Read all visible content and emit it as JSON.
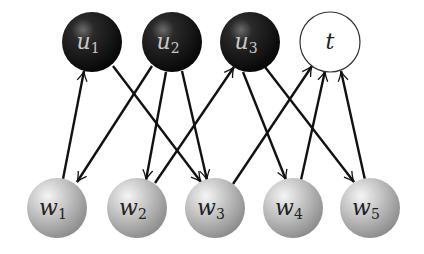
{
  "diagram": {
    "type": "bipartite-directed-graph",
    "top_nodes": [
      {
        "id": "u1",
        "label": "u",
        "sub": "1",
        "cx": 92,
        "cy": 42,
        "style": "dark"
      },
      {
        "id": "u2",
        "label": "u",
        "sub": "2",
        "cx": 172,
        "cy": 42,
        "style": "dark"
      },
      {
        "id": "u3",
        "label": "u",
        "sub": "3",
        "cx": 250,
        "cy": 42,
        "style": "dark"
      },
      {
        "id": "t",
        "label": "t",
        "sub": "",
        "cx": 330,
        "cy": 42,
        "style": "white"
      }
    ],
    "bottom_nodes": [
      {
        "id": "w1",
        "label": "w",
        "sub": "1",
        "cx": 57,
        "cy": 208,
        "style": "gray"
      },
      {
        "id": "w2",
        "label": "w",
        "sub": "2",
        "cx": 137,
        "cy": 208,
        "style": "gray"
      },
      {
        "id": "w3",
        "label": "w",
        "sub": "3",
        "cx": 215,
        "cy": 208,
        "style": "gray"
      },
      {
        "id": "w4",
        "label": "w",
        "sub": "4",
        "cx": 293,
        "cy": 208,
        "style": "gray"
      },
      {
        "id": "w5",
        "label": "w",
        "sub": "5",
        "cx": 370,
        "cy": 208,
        "style": "gray"
      }
    ],
    "edges": [
      {
        "from": "w1",
        "to": "u1",
        "x1": 63,
        "y1": 179,
        "x2": 84,
        "y2": 71
      },
      {
        "from": "u1",
        "to": "w3",
        "x1": 113,
        "y1": 66,
        "x2": 201,
        "y2": 182
      },
      {
        "from": "u2",
        "to": "w1",
        "x1": 152,
        "y1": 66,
        "x2": 77,
        "y2": 182
      },
      {
        "from": "u2",
        "to": "w2",
        "x1": 166,
        "y1": 72,
        "x2": 146,
        "y2": 180
      },
      {
        "from": "u2",
        "to": "w3",
        "x1": 182,
        "y1": 71,
        "x2": 207,
        "y2": 180
      },
      {
        "from": "w2",
        "to": "u3",
        "x1": 155,
        "y1": 183,
        "x2": 234,
        "y2": 67
      },
      {
        "from": "u3",
        "to": "w4",
        "x1": 243,
        "y1": 72,
        "x2": 286,
        "y2": 180
      },
      {
        "from": "u3",
        "to": "w5",
        "x1": 265,
        "y1": 67,
        "x2": 354,
        "y2": 182
      },
      {
        "from": "w3",
        "to": "t",
        "x1": 233,
        "y1": 184,
        "x2": 312,
        "y2": 66
      },
      {
        "from": "w4",
        "to": "t",
        "x1": 301,
        "y1": 180,
        "x2": 325,
        "y2": 71
      },
      {
        "from": "w5",
        "to": "t",
        "x1": 365,
        "y1": 180,
        "x2": 341,
        "y2": 71
      }
    ],
    "node_radius": 30,
    "colors": {
      "dark_node": "#111111",
      "gray_node": "#b5b5b5",
      "white_node": "#ffffff",
      "edge": "#111111",
      "dark_label": "#c8c8c8",
      "light_label": "#222222"
    }
  }
}
